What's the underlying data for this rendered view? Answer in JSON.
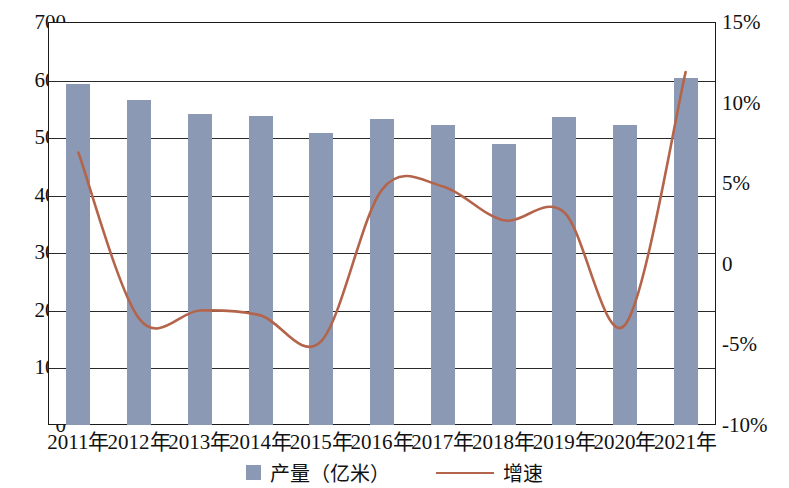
{
  "chart_data": {
    "type": "bar",
    "title": "",
    "subtitle": "",
    "xlabel": "",
    "ylabel": "",
    "ylabel_right": "",
    "grid": true,
    "legend_position": "bottom",
    "categories": [
      "2011年",
      "2012年",
      "2013年",
      "2014年",
      "2015年",
      "2016年",
      "2017年",
      "2018年",
      "2019年",
      "2020年",
      "2021年"
    ],
    "ylim": [
      0,
      700
    ],
    "yticks": [
      "0",
      "100",
      "200",
      "300",
      "400",
      "500",
      "600",
      "700"
    ],
    "ylim_right": [
      -10,
      15
    ],
    "yticks_right": [
      "-10%",
      "-5%",
      "0",
      "5%",
      "10%",
      "15%"
    ],
    "series": [
      {
        "name": "产量（亿米）",
        "type": "bar",
        "color": "#8c99b4",
        "axis": "left",
        "unit": "亿米",
        "values": [
          593,
          564,
          541,
          536,
          508,
          531,
          521,
          489,
          535,
          521,
          602
        ]
      },
      {
        "name": "增速",
        "type": "line",
        "color": "#b4644a",
        "axis": "right",
        "unit": "%",
        "values": [
          6.9,
          -3.4,
          -2.9,
          -3.2,
          -4.8,
          4.6,
          4.8,
          2.7,
          3.2,
          -3.8,
          11.9
        ]
      }
    ]
  },
  "legend": {
    "items": [
      {
        "label": "产量（亿米）",
        "marker": "square-swatch",
        "color": "#8c99b4"
      },
      {
        "label": "增速",
        "marker": "line-swatch",
        "color": "#b4644a"
      }
    ]
  },
  "axes": {
    "left": {
      "ticks": [
        "700",
        "600",
        "500",
        "400",
        "300",
        "200",
        "100",
        "0"
      ]
    },
    "right": {
      "ticks": [
        "15%",
        "10%",
        "5%",
        "0",
        "-5%",
        "-10%"
      ]
    },
    "bottom": {
      "ticks": [
        "2011年",
        "2012年",
        "2013年",
        "2014年",
        "2015年",
        "2016年",
        "2017年",
        "2018年",
        "2019年",
        "2020年",
        "2021年"
      ]
    }
  },
  "colors": {
    "bar": "#8c99b4",
    "line": "#b4644a",
    "axis": "#1a1a1a",
    "background": "#ffffff"
  }
}
